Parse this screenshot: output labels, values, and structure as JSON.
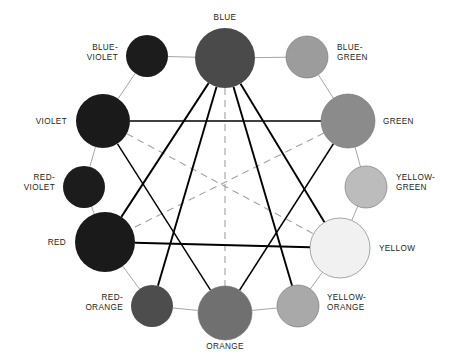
{
  "diagram": {
    "type": "color-wheel",
    "center": {
      "x": 225,
      "y": 185
    },
    "background": "#ffffff",
    "label_color": "#231f20",
    "ring_link_color": "#9b9b9b",
    "chord_color": "#000000",
    "complement_color": "#a2a2a2",
    "nodes": [
      {
        "id": "blue",
        "label": "BLUE",
        "color": "#4a4a4a",
        "radius": 30,
        "cx": 225,
        "cy": 58,
        "kind": "primary",
        "label_x": 225,
        "label_y": 20,
        "anchor": "middle",
        "lines": [
          "BLUE"
        ]
      },
      {
        "id": "blue-green",
        "label": "BLUE-GREEN",
        "color": "#9c9c9c",
        "radius": 21,
        "cx": 307,
        "cy": 57,
        "kind": "tertiary",
        "label_x": 337,
        "label_y": 50,
        "anchor": "start",
        "lines": [
          "BLUE-",
          "GREEN"
        ]
      },
      {
        "id": "green",
        "label": "GREEN",
        "color": "#8b8b8b",
        "radius": 27,
        "cx": 348,
        "cy": 121,
        "kind": "secondary",
        "label_x": 383,
        "label_y": 124,
        "anchor": "start",
        "lines": [
          "GREEN"
        ]
      },
      {
        "id": "yellow-green",
        "label": "YELLOW-GREEN",
        "color": "#bcbcbc",
        "radius": 21,
        "cx": 366,
        "cy": 187,
        "kind": "tertiary",
        "label_x": 396,
        "label_y": 180,
        "anchor": "start",
        "lines": [
          "YELLOW-",
          "GREEN"
        ]
      },
      {
        "id": "yellow",
        "label": "YELLOW",
        "color": "#f1f1f1",
        "radius": 30,
        "cx": 340,
        "cy": 248,
        "kind": "primary",
        "label_x": 379,
        "label_y": 251,
        "anchor": "start",
        "lines": [
          "YELLOW"
        ]
      },
      {
        "id": "yellow-orange",
        "label": "YELLOW-ORANGE",
        "color": "#a9a9a9",
        "radius": 21,
        "cx": 298,
        "cy": 306,
        "kind": "tertiary",
        "label_x": 327,
        "label_y": 300,
        "anchor": "start",
        "lines": [
          "YELLOW-",
          "ORANGE"
        ]
      },
      {
        "id": "orange",
        "label": "ORANGE",
        "color": "#707070",
        "radius": 27,
        "cx": 225,
        "cy": 313,
        "kind": "secondary",
        "label_x": 225,
        "label_y": 349,
        "anchor": "middle",
        "lines": [
          "ORANGE"
        ]
      },
      {
        "id": "red-orange",
        "label": "RED-ORANGE",
        "color": "#4d4d4d",
        "radius": 21,
        "cx": 152,
        "cy": 306,
        "kind": "tertiary",
        "label_x": 123,
        "label_y": 300,
        "anchor": "end",
        "lines": [
          "RED-",
          "ORANGE"
        ]
      },
      {
        "id": "red",
        "label": "RED",
        "color": "#1a1a1a",
        "radius": 30,
        "cx": 105,
        "cy": 242,
        "kind": "primary",
        "label_x": 66,
        "label_y": 245,
        "anchor": "end",
        "lines": [
          "RED"
        ]
      },
      {
        "id": "red-violet",
        "label": "RED-VIOLET",
        "color": "#1c1c1c",
        "radius": 21,
        "cx": 84,
        "cy": 187,
        "kind": "tertiary",
        "label_x": 55,
        "label_y": 180,
        "anchor": "end",
        "lines": [
          "RED-",
          "VIOLET"
        ]
      },
      {
        "id": "violet",
        "label": "VIOLET",
        "color": "#1a1a1a",
        "radius": 27,
        "cx": 103,
        "cy": 121,
        "kind": "secondary",
        "label_x": 67,
        "label_y": 124,
        "anchor": "end",
        "lines": [
          "VIOLET"
        ]
      },
      {
        "id": "blue-violet",
        "label": "BLUE-VIOLET",
        "color": "#1c1c1c",
        "radius": 21,
        "cx": 147,
        "cy": 56,
        "kind": "tertiary",
        "label_x": 118,
        "label_y": 50,
        "anchor": "end",
        "lines": [
          "BLUE-",
          "VIOLET"
        ]
      }
    ],
    "ring_links": [
      [
        "blue",
        "blue-green"
      ],
      [
        "blue-green",
        "green"
      ],
      [
        "green",
        "yellow-green"
      ],
      [
        "yellow-green",
        "yellow"
      ],
      [
        "yellow",
        "yellow-orange"
      ],
      [
        "yellow-orange",
        "orange"
      ],
      [
        "orange",
        "red-orange"
      ],
      [
        "red-orange",
        "red"
      ],
      [
        "red",
        "red-violet"
      ],
      [
        "red-violet",
        "violet"
      ],
      [
        "violet",
        "blue-violet"
      ],
      [
        "blue-violet",
        "blue"
      ]
    ],
    "triads": [
      {
        "name": "primary-triad",
        "nodes": [
          "blue",
          "yellow",
          "red"
        ],
        "weight": 1.9
      },
      {
        "name": "secondary-triad",
        "nodes": [
          "green",
          "orange",
          "violet"
        ],
        "weight": 1.45
      }
    ],
    "split_chords": [
      {
        "name": "blue-yellow-orange",
        "from": "blue",
        "to": "yellow-orange"
      },
      {
        "name": "blue-red-orange",
        "from": "blue",
        "to": "red-orange"
      }
    ],
    "complements": [
      {
        "name": "blue-orange",
        "from": "blue",
        "to": "orange"
      },
      {
        "name": "violet-yellow",
        "from": "violet",
        "to": "yellow"
      },
      {
        "name": "green-red",
        "from": "green",
        "to": "red"
      }
    ]
  }
}
